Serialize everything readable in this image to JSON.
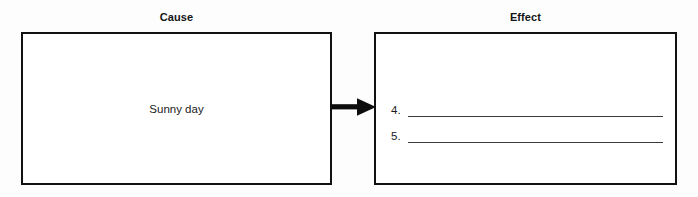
{
  "diagram": {
    "type": "cause-and-effect",
    "columns": {
      "cause_heading": "Cause",
      "effect_heading": "Effect"
    },
    "cause_box": {
      "text": "Sunny day"
    },
    "effect_box": {
      "answer_lines": [
        {
          "number": "4.",
          "value": ""
        },
        {
          "number": "5.",
          "value": ""
        }
      ]
    },
    "connector": {
      "icon": "right-arrow-icon",
      "direction": "right"
    },
    "colors": {
      "border": "#111111",
      "text": "#1b1b1b",
      "rule": "#3a3a3a",
      "background": "#ffffff"
    }
  }
}
